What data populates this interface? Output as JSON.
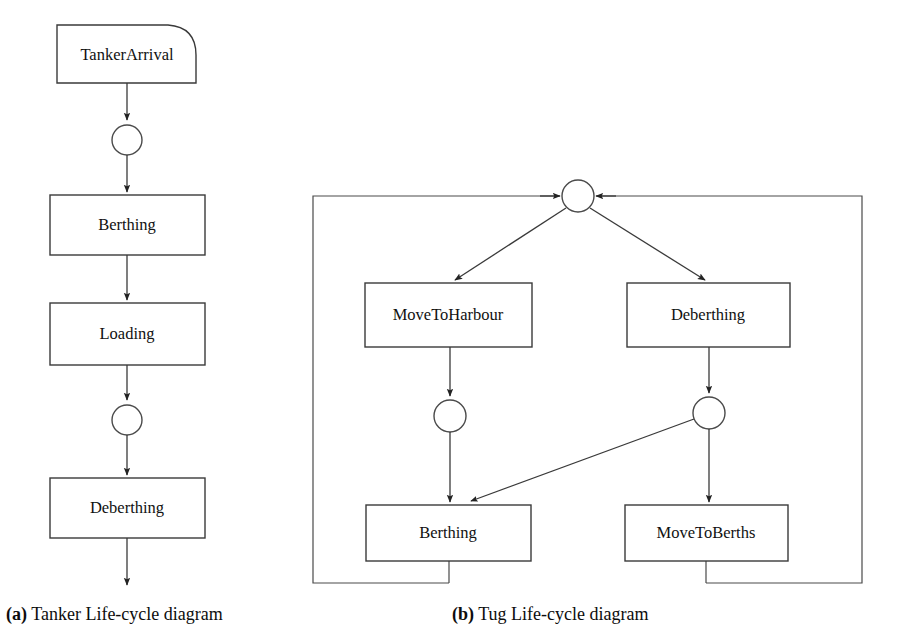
{
  "figure": {
    "type": "flowchart",
    "background": "#ffffff",
    "stroke_color": "#3a3a3a",
    "text_color": "#111111",
    "panels": [
      {
        "id": "a",
        "caption_tag": "(a)",
        "caption_text": " Tanker Life-cycle diagram",
        "nodes": [
          {
            "id": "tanker-arrival",
            "label": "TankerArrival",
            "shape": "event-rounded-corner",
            "x": 57,
            "y": 25,
            "w": 139,
            "h": 58
          },
          {
            "id": "state-1",
            "label": "",
            "shape": "circle",
            "cx": 127,
            "cy": 140,
            "r": 15
          },
          {
            "id": "berthing-a",
            "label": "Berthing",
            "shape": "rect",
            "x": 50,
            "y": 195,
            "w": 155,
            "h": 60
          },
          {
            "id": "loading",
            "label": "Loading",
            "shape": "rect",
            "x": 50,
            "y": 303,
            "w": 155,
            "h": 62
          },
          {
            "id": "state-2",
            "label": "",
            "shape": "circle",
            "cx": 127,
            "cy": 420,
            "r": 15
          },
          {
            "id": "deberthing-a",
            "label": "Deberthing",
            "shape": "rect",
            "x": 50,
            "y": 478,
            "w": 155,
            "h": 60
          }
        ],
        "edges": [
          {
            "from": "tanker-arrival",
            "to": "state-1",
            "arrow": true
          },
          {
            "from": "state-1",
            "to": "berthing-a",
            "arrow": true
          },
          {
            "from": "berthing-a",
            "to": "loading",
            "arrow": true
          },
          {
            "from": "loading",
            "to": "state-2",
            "arrow": true
          },
          {
            "from": "state-2",
            "to": "deberthing-a",
            "arrow": true
          },
          {
            "from": "deberthing-a",
            "to": "exit",
            "arrow": true
          }
        ]
      },
      {
        "id": "b",
        "caption_tag": "(b)",
        "caption_text": " Tug Life-cycle diagram",
        "nodes": [
          {
            "id": "state-top",
            "label": "",
            "shape": "circle",
            "cx": 578,
            "cy": 196,
            "r": 16
          },
          {
            "id": "move-to-harbour",
            "label": "MoveToHarbour",
            "shape": "rect",
            "x": 365,
            "y": 283,
            "w": 167,
            "h": 64
          },
          {
            "id": "deberthing-b",
            "label": "Deberthing",
            "shape": "rect",
            "x": 627,
            "y": 283,
            "w": 163,
            "h": 64
          },
          {
            "id": "state-left",
            "label": "",
            "shape": "circle",
            "cx": 450,
            "cy": 416,
            "r": 16
          },
          {
            "id": "state-right",
            "label": "",
            "shape": "circle",
            "cx": 709,
            "cy": 413,
            "r": 16
          },
          {
            "id": "berthing-b",
            "label": "Berthing",
            "shape": "rect",
            "x": 366,
            "y": 505,
            "w": 165,
            "h": 56
          },
          {
            "id": "move-to-berths",
            "label": "MoveToBerths",
            "shape": "rect",
            "x": 625,
            "y": 505,
            "w": 163,
            "h": 56
          }
        ],
        "edges": [
          {
            "from": "state-top",
            "to": "move-to-harbour",
            "arrow": true,
            "style": "diagonal"
          },
          {
            "from": "state-top",
            "to": "deberthing-b",
            "arrow": true,
            "style": "diagonal"
          },
          {
            "from": "move-to-harbour",
            "to": "state-left",
            "arrow": true
          },
          {
            "from": "state-left",
            "to": "berthing-b",
            "arrow": true
          },
          {
            "from": "deberthing-b",
            "to": "state-right",
            "arrow": true
          },
          {
            "from": "state-right",
            "to": "move-to-berths",
            "arrow": true
          },
          {
            "from": "state-right",
            "to": "berthing-b",
            "arrow": true,
            "style": "diagonal"
          },
          {
            "from": "berthing-b",
            "to": "state-top",
            "arrow": true,
            "style": "loop-left"
          },
          {
            "from": "move-to-berths",
            "to": "state-top",
            "arrow": true,
            "style": "loop-right"
          }
        ],
        "frame": {
          "x": 313,
          "y": 196,
          "w": 549,
          "h": 387
        }
      }
    ]
  }
}
